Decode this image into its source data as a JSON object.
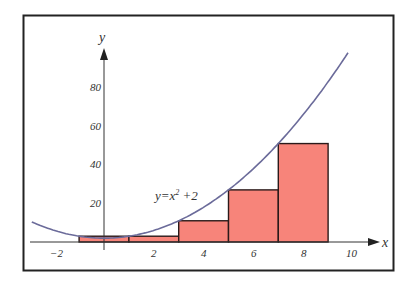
{
  "chart_data": {
    "type": "bar",
    "title": "",
    "function_label": "y=x²+2",
    "function": "x^2+2",
    "xlabel": "x",
    "ylabel": "y",
    "xlim": [
      -3,
      10.5
    ],
    "ylim": [
      0,
      100
    ],
    "x_ticks": [
      -2,
      2,
      4,
      6,
      8,
      10
    ],
    "y_ticks": [
      20,
      40,
      60,
      80
    ],
    "rectangles": [
      {
        "x_start": -1,
        "x_end": 1,
        "height": 3
      },
      {
        "x_start": 1,
        "x_end": 3,
        "height": 3
      },
      {
        "x_start": 3,
        "x_end": 5,
        "height": 11
      },
      {
        "x_start": 5,
        "x_end": 7,
        "height": 27
      },
      {
        "x_start": 7,
        "x_end": 9,
        "height": 51
      }
    ],
    "curve_domain": [
      -2.9,
      9.8
    ],
    "grid": false,
    "colors": {
      "rect_fill": "#f7847a",
      "rect_stroke": "#2a1a1a",
      "curve": "#6b6b9a",
      "axis": "#333333",
      "frame": "#222222"
    }
  },
  "labels": {
    "x_axis": "x",
    "y_axis": "y",
    "equation_main": "y=x",
    "equation_sup": "2",
    "equation_tail": " +2",
    "x_ticks": [
      "−2",
      "2",
      "4",
      "6",
      "8",
      "10"
    ],
    "y_ticks": [
      "20",
      "40",
      "60",
      "80"
    ]
  }
}
